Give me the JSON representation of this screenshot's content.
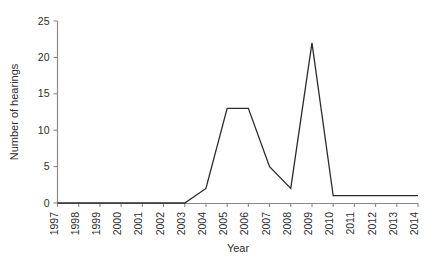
{
  "chart_data": {
    "type": "line",
    "title": "",
    "xlabel": "Year",
    "ylabel": "Number of hearings",
    "categories": [
      "1997",
      "1998",
      "1999",
      "2000",
      "2001",
      "2002",
      "2003",
      "2004",
      "2005",
      "2006",
      "2007",
      "2008",
      "2009",
      "2010",
      "2011",
      "2012",
      "2013",
      "2014"
    ],
    "x": [
      1997,
      1998,
      1999,
      2000,
      2001,
      2002,
      2003,
      2004,
      2005,
      2006,
      2007,
      2008,
      2009,
      2010,
      2011,
      2012,
      2013,
      2014
    ],
    "values": [
      0,
      0,
      0,
      0,
      0,
      0,
      0,
      2,
      13,
      13,
      5,
      2,
      22,
      1,
      1,
      1,
      1,
      1
    ],
    "series": [
      {
        "name": "Number of hearings",
        "values": [
          0,
          0,
          0,
          0,
          0,
          0,
          0,
          2,
          13,
          13,
          5,
          2,
          22,
          1,
          1,
          1,
          1,
          1
        ]
      }
    ],
    "xlim": [
      1997,
      2014
    ],
    "ylim": [
      0,
      25
    ],
    "yticks": [
      0,
      5,
      10,
      15,
      20,
      25
    ],
    "ytick_labels": [
      "0",
      "5",
      "10",
      "15",
      "20",
      "25"
    ],
    "grid": false,
    "legend": false,
    "legend_position": "none",
    "line_color": "#2b2b2b",
    "axis_color": "#8a8a8a",
    "background_color": "#ffffff",
    "xtick_label_rotation": -90
  },
  "axes": {
    "y_label": "Number of hearings",
    "x_label": "Year"
  }
}
